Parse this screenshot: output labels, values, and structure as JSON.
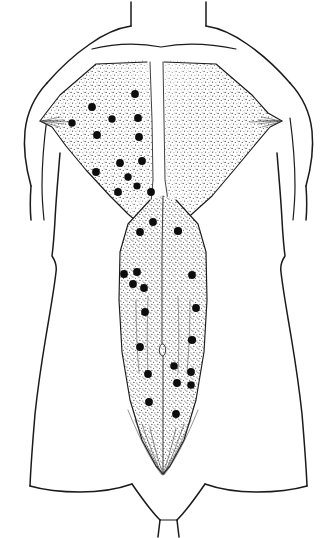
{
  "figure": {
    "title": "Posterior trunk trigger point chart",
    "view": "posterior",
    "caption": "",
    "background_color": "#ffffff",
    "ink_color": "#1a1a1a",
    "trigger_point_color": "#0d0d0d",
    "stipple_color": "#2b2b2b",
    "canvas": {
      "width": 330,
      "height": 538
    }
  },
  "regions": [
    {
      "name": "neck",
      "label": "Neck"
    },
    {
      "name": "left-shoulder",
      "label": "Left shoulder"
    },
    {
      "name": "right-shoulder",
      "label": "Right shoulder"
    },
    {
      "name": "upper-trapezius-left",
      "label": "Upper trapezius (left)"
    },
    {
      "name": "upper-trapezius-right",
      "label": "Upper trapezius (right)"
    },
    {
      "name": "mid-back",
      "label": "Mid back"
    },
    {
      "name": "lumbar",
      "label": "Lumbar"
    },
    {
      "name": "sacral",
      "label": "Sacral"
    },
    {
      "name": "gluteal-cleft",
      "label": "Gluteal cleft"
    },
    {
      "name": "left-arm",
      "label": "Left arm"
    },
    {
      "name": "right-arm",
      "label": "Right arm"
    }
  ],
  "chart_data": {
    "type": "scatter",
    "title": "Posterior trunk trigger point chart",
    "subtitle": "",
    "xlabel": "",
    "ylabel": "",
    "xlim": [
      0,
      330
    ],
    "ylim": [
      0,
      538
    ],
    "grid": false,
    "legend": [],
    "annotations": [],
    "series": [
      {
        "name": "Trigger points",
        "marker": "filled-circle",
        "color": "#0d0d0d",
        "count": 33,
        "points": [
          {
            "x": 135,
            "y": 94,
            "r": 3.9,
            "region": "upper-trapezius-left"
          },
          {
            "x": 92,
            "y": 107,
            "r": 3.9,
            "region": "upper-trapezius-left"
          },
          {
            "x": 72,
            "y": 123,
            "r": 3.7,
            "region": "upper-trapezius-left"
          },
          {
            "x": 112,
            "y": 119,
            "r": 3.7,
            "region": "upper-trapezius-left"
          },
          {
            "x": 138,
            "y": 118,
            "r": 3.9,
            "region": "upper-trapezius-left"
          },
          {
            "x": 97,
            "y": 135,
            "r": 3.9,
            "region": "upper-trapezius-left"
          },
          {
            "x": 139,
            "y": 137,
            "r": 3.9,
            "region": "upper-trapezius-left"
          },
          {
            "x": 120,
            "y": 163,
            "r": 3.9,
            "region": "upper-trapezius-left"
          },
          {
            "x": 142,
            "y": 161,
            "r": 3.9,
            "region": "upper-trapezius-left"
          },
          {
            "x": 96,
            "y": 172,
            "r": 3.9,
            "region": "upper-trapezius-left"
          },
          {
            "x": 128,
            "y": 177,
            "r": 3.7,
            "region": "upper-trapezius-left"
          },
          {
            "x": 137,
            "y": 186,
            "r": 3.6,
            "region": "mid-back"
          },
          {
            "x": 118,
            "y": 192,
            "r": 3.9,
            "region": "mid-back"
          },
          {
            "x": 151,
            "y": 192,
            "r": 3.9,
            "region": "mid-back"
          },
          {
            "x": 153,
            "y": 222,
            "r": 3.9,
            "region": "mid-back"
          },
          {
            "x": 140,
            "y": 232,
            "r": 3.9,
            "region": "mid-back"
          },
          {
            "x": 178,
            "y": 231,
            "r": 4.1,
            "region": "mid-back"
          },
          {
            "x": 124,
            "y": 274,
            "r": 3.9,
            "region": "lumbar"
          },
          {
            "x": 137,
            "y": 272,
            "r": 3.9,
            "region": "lumbar"
          },
          {
            "x": 133,
            "y": 284,
            "r": 3.9,
            "region": "lumbar"
          },
          {
            "x": 144,
            "y": 288,
            "r": 3.9,
            "region": "lumbar"
          },
          {
            "x": 192,
            "y": 275,
            "r": 3.9,
            "region": "lumbar"
          },
          {
            "x": 196,
            "y": 308,
            "r": 3.9,
            "region": "lumbar"
          },
          {
            "x": 145,
            "y": 312,
            "r": 3.9,
            "region": "lumbar"
          },
          {
            "x": 192,
            "y": 340,
            "r": 4.1,
            "region": "lumbar"
          },
          {
            "x": 140,
            "y": 347,
            "r": 3.9,
            "region": "lumbar"
          },
          {
            "x": 191,
            "y": 372,
            "r": 3.9,
            "region": "sacral"
          },
          {
            "x": 174,
            "y": 366,
            "r": 3.8,
            "region": "sacral"
          },
          {
            "x": 148,
            "y": 374,
            "r": 3.9,
            "region": "sacral"
          },
          {
            "x": 177,
            "y": 383,
            "r": 3.9,
            "region": "sacral"
          },
          {
            "x": 191,
            "y": 385,
            "r": 3.8,
            "region": "sacral"
          },
          {
            "x": 149,
            "y": 402,
            "r": 3.9,
            "region": "sacral"
          },
          {
            "x": 176,
            "y": 414,
            "r": 3.9,
            "region": "sacral"
          }
        ]
      }
    ]
  }
}
